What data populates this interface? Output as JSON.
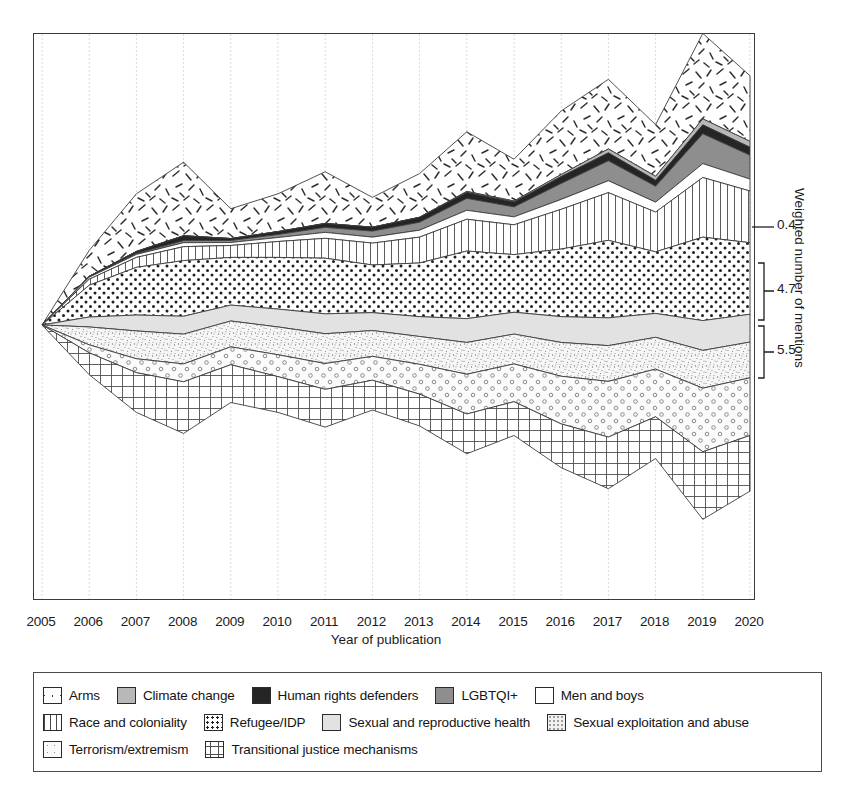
{
  "chart_data": {
    "type": "area",
    "title": "",
    "xlabel": "Year of publication",
    "ylabel": "Weighted number of mentions",
    "x": [
      2005,
      2006,
      2007,
      2008,
      2009,
      2010,
      2011,
      2012,
      2013,
      2014,
      2015,
      2016,
      2017,
      2018,
      2019,
      2020
    ],
    "xlim": [
      2005,
      2020
    ],
    "grid": true,
    "legend_position": "bottom",
    "stack_mode": "streamgraph-centered",
    "series": [
      {
        "name": "Arms",
        "pattern": "scattered-dashes",
        "color": "#ffffff",
        "values": [
          0.0,
          1.3,
          2.9,
          3.7,
          1.5,
          1.9,
          2.6,
          1.5,
          2.2,
          3.0,
          2.1,
          3.2,
          3.5,
          2.6,
          4.3,
          3.3
        ]
      },
      {
        "name": "Climate change",
        "pattern": "solid-gray",
        "color": "#b8b8b8",
        "values": [
          0.0,
          0.0,
          0.0,
          0.0,
          0.0,
          0.0,
          0.0,
          0.0,
          0.0,
          0.05,
          0.05,
          0.1,
          0.2,
          0.2,
          0.3,
          0.3
        ]
      },
      {
        "name": "Human rights defenders",
        "pattern": "solid-dark",
        "color": "#252525",
        "values": [
          0.0,
          0.05,
          0.1,
          0.25,
          0.1,
          0.15,
          0.2,
          0.2,
          0.25,
          0.3,
          0.25,
          0.35,
          0.4,
          0.3,
          0.45,
          0.4
        ]
      },
      {
        "name": "LGBTQI+",
        "pattern": "solid-midgray",
        "color": "#8e8e8e",
        "values": [
          0.0,
          0.0,
          0.05,
          0.1,
          0.1,
          0.15,
          0.25,
          0.3,
          0.4,
          0.6,
          0.5,
          0.8,
          1.0,
          0.8,
          1.5,
          1.2
        ]
      },
      {
        "name": "Men and boys",
        "pattern": "plain-white",
        "color": "#ffffff",
        "values": [
          0.0,
          0.1,
          0.15,
          0.2,
          0.15,
          0.2,
          0.3,
          0.3,
          0.35,
          0.45,
          0.4,
          0.5,
          0.6,
          0.5,
          0.7,
          0.6
        ]
      },
      {
        "name": "Race and coloniality",
        "pattern": "vertical-lines",
        "color": "#ffffff",
        "values": [
          0.0,
          0.3,
          0.5,
          0.7,
          0.6,
          0.8,
          1.0,
          1.1,
          1.3,
          1.6,
          1.5,
          2.0,
          2.4,
          2.0,
          3.0,
          2.6
        ]
      },
      {
        "name": "Refugee/IDP",
        "pattern": "dense-dots",
        "color": "#ffffff",
        "values": [
          0.0,
          1.6,
          2.4,
          2.8,
          2.4,
          2.6,
          2.8,
          2.4,
          2.7,
          3.4,
          2.9,
          3.4,
          3.9,
          3.1,
          4.2,
          3.6
        ]
      },
      {
        "name": "Sexual and reproductive health",
        "pattern": "light-gray",
        "color": "#e2e2e2",
        "values": [
          0.0,
          0.5,
          0.8,
          0.9,
          0.8,
          0.9,
          1.0,
          0.9,
          1.0,
          1.2,
          1.1,
          1.3,
          1.4,
          1.2,
          1.5,
          1.4
        ]
      },
      {
        "name": "Sexual exploitation and abuse",
        "pattern": "fine-speckle",
        "color": "#f1f1f1",
        "values": [
          0.0,
          0.9,
          1.4,
          1.5,
          1.3,
          1.4,
          1.5,
          1.3,
          1.4,
          1.6,
          1.5,
          1.7,
          1.8,
          1.6,
          1.9,
          1.8
        ]
      },
      {
        "name": "Terrorism/extremism",
        "pattern": "sparse-circles",
        "color": "#fafafa",
        "values": [
          0.0,
          0.4,
          0.7,
          0.9,
          0.9,
          1.1,
          1.3,
          1.2,
          1.5,
          2.0,
          1.9,
          2.4,
          2.8,
          2.4,
          3.2,
          2.9
        ]
      },
      {
        "name": "Transitional justice mechanisms",
        "pattern": "grid-crosshatch",
        "color": "#ffffff",
        "values": [
          0.0,
          1.1,
          2.0,
          2.6,
          1.9,
          1.8,
          1.9,
          1.5,
          1.6,
          2.0,
          1.7,
          2.2,
          2.6,
          2.1,
          3.4,
          2.8
        ]
      }
    ],
    "bracket_annotations": [
      {
        "label": "0.4",
        "series": "Human rights defenders"
      },
      {
        "label": "4.7",
        "series": "Race and coloniality"
      },
      {
        "label": "5.5",
        "series": "Refugee/IDP"
      }
    ]
  },
  "axis": {
    "x_title": "Year of publication",
    "y_title": "Weighted number of mentions",
    "x_ticks": [
      "2005",
      "2006",
      "2007",
      "2008",
      "2009",
      "2010",
      "2011",
      "2012",
      "2013",
      "2014",
      "2015",
      "2016",
      "2017",
      "2018",
      "2019",
      "2020"
    ]
  },
  "annotations": {
    "a0": "0.4",
    "a1": "4.7",
    "a2": "5.5"
  },
  "legend": {
    "rows": [
      [
        {
          "label": "Arms",
          "swatch": "sw-arms"
        },
        {
          "label": "Climate change",
          "swatch": "sw-climate"
        },
        {
          "label": "Human rights defenders",
          "swatch": "sw-hrd"
        },
        {
          "label": "LGBTQI+",
          "swatch": "sw-lgbtqi"
        },
        {
          "label": "Men and boys",
          "swatch": "sw-menboys"
        }
      ],
      [
        {
          "label": "Race and coloniality",
          "swatch": "sw-race"
        },
        {
          "label": "Refugee/IDP",
          "swatch": "sw-refugee"
        },
        {
          "label": "Sexual and reproductive health",
          "swatch": "sw-srh"
        },
        {
          "label": "Sexual exploitation and abuse",
          "swatch": "sw-sea"
        }
      ],
      [
        {
          "label": "Terrorism/extremism",
          "swatch": "sw-terror"
        },
        {
          "label": "Transitional justice mechanisms",
          "swatch": "sw-tjm"
        }
      ]
    ]
  }
}
